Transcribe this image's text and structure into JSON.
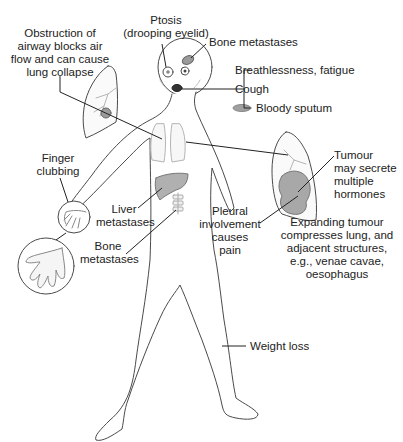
{
  "diagram": {
    "type": "anatomical-annotation",
    "colors": {
      "outline": "#4a4a4a",
      "leader": "#222222",
      "organ_fill": "#bdbdbd",
      "lung_fill": "#f2f2f2",
      "text": "#222222"
    },
    "labels": {
      "ptosis": "Ptosis\n(drooping eyelid)",
      "bone_metastases_skull": "Bone metastases",
      "breathlessness": "Breathlessness, fatigue",
      "cough": "Cough",
      "bloody_sputum": "Bloody sputum",
      "obstruction": "Obstruction of\nairway blocks air\nflow and can cause\nlung collapse",
      "tumour_hormones": "Tumour\nmay secrete\nmultiple\nhormones",
      "finger_clubbing": "Finger\nclubbing",
      "liver_metastases": "Liver\nmetastases",
      "bone_metastases_spine": "Bone\nmetastases",
      "pleural": "Pleural\ninvolvement\ncauses\npain",
      "expanding_tumour": "Expanding tumour\ncompresses lung, and\nadjacent structures,\ne.g., venae cavae,\noesophagus",
      "weight_loss": "Weight loss"
    },
    "icons": [
      "human-figure-outline",
      "lung-inset-left",
      "lung-inset-right",
      "hand-inset-small",
      "hand-inset-large",
      "liver-icon",
      "spine-icon",
      "sputum-icon"
    ]
  }
}
